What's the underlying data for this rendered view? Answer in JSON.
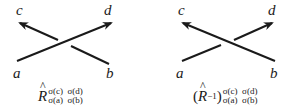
{
  "diagrams": [
    {
      "id": "left",
      "labels": {
        "top_left": "c",
        "top_right": "d",
        "bottom_left": "a",
        "bottom_right": "b"
      },
      "over_strand": "a-to-d",
      "under_strand": "b-to-c",
      "formula": {
        "symbol": "R",
        "hat": "^",
        "inverse": "",
        "superscript": "σ(c)  σ(d)",
        "subscript": "σ(a)  σ(b)"
      }
    },
    {
      "id": "right",
      "labels": {
        "top_left": "c",
        "top_right": "d",
        "bottom_left": "a",
        "bottom_right": "b"
      },
      "over_strand": "b-to-c",
      "under_strand": "a-to-d",
      "formula": {
        "open_paren": "(",
        "symbol": "R",
        "hat": "^",
        "inverse": "−1",
        "close_paren": ")",
        "superscript": "σ(c)  σ(d)",
        "subscript": "σ(a)  σ(b)"
      }
    }
  ],
  "colors": {
    "stroke": "#1a1a1a",
    "background": "#ffffff"
  }
}
